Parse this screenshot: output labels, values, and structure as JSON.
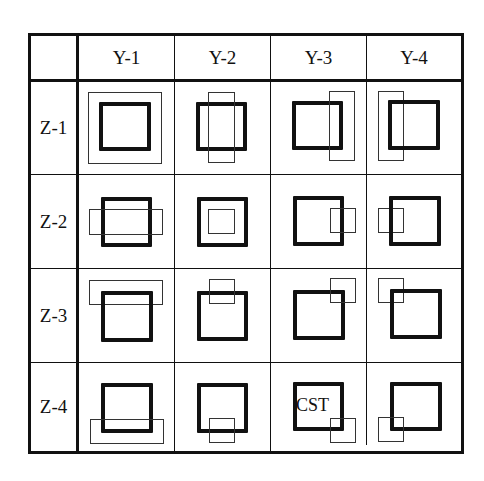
{
  "diagram": {
    "column_headers": [
      "Y-1",
      "Y-2",
      "Y-3",
      "Y-4"
    ],
    "row_headers": [
      "Z-1",
      "Z-2",
      "Z-3",
      "Z-4"
    ],
    "annotation": "CST",
    "colors": {
      "line": "#111111",
      "background": "#ffffff"
    },
    "cells": [
      {
        "row": "Z-1",
        "col": "Y-1",
        "desc": "thin large square enclosing thick square"
      },
      {
        "row": "Z-1",
        "col": "Y-2",
        "desc": "thin tall rectangle centered over thick square"
      },
      {
        "row": "Z-1",
        "col": "Y-3",
        "desc": "thin tall rectangle at right edge of thick square"
      },
      {
        "row": "Z-1",
        "col": "Y-4",
        "desc": "thin tall rectangle at left edge of thick square"
      },
      {
        "row": "Z-2",
        "col": "Y-1",
        "desc": "thin wide rectangle centered across thick square"
      },
      {
        "row": "Z-2",
        "col": "Y-2",
        "desc": "thin small square centered inside thick square"
      },
      {
        "row": "Z-2",
        "col": "Y-3",
        "desc": "thin small square at right edge of thick square"
      },
      {
        "row": "Z-2",
        "col": "Y-4",
        "desc": "thin small square at left edge of thick square"
      },
      {
        "row": "Z-3",
        "col": "Y-1",
        "desc": "thin wide rectangle at top edge of thick square"
      },
      {
        "row": "Z-3",
        "col": "Y-2",
        "desc": "thin small square at top center of thick square"
      },
      {
        "row": "Z-3",
        "col": "Y-3",
        "desc": "thin small square at top-right corner of thick square"
      },
      {
        "row": "Z-3",
        "col": "Y-4",
        "desc": "thin small square at top-left corner of thick square"
      },
      {
        "row": "Z-4",
        "col": "Y-1",
        "desc": "thin wide rectangle at bottom edge of thick square"
      },
      {
        "row": "Z-4",
        "col": "Y-2",
        "desc": "thin small square at bottom center of thick square"
      },
      {
        "row": "Z-4",
        "col": "Y-3",
        "desc": "thin small square at bottom-right corner of thick square, labeled CST"
      },
      {
        "row": "Z-4",
        "col": "Y-4",
        "desc": "thin small square at bottom-left corner of thick square"
      }
    ]
  }
}
